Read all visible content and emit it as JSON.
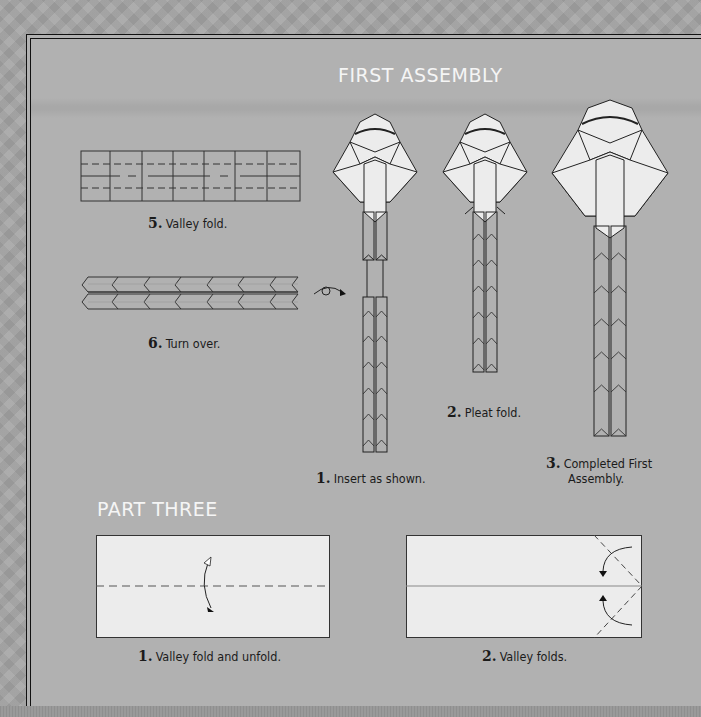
{
  "sections": {
    "first_assembly": {
      "title": "FIRST ASSEMBLY"
    },
    "part_three": {
      "title": "PART THREE"
    }
  },
  "steps_left": [
    {
      "number": "5.",
      "text": "Valley fold."
    },
    {
      "number": "6.",
      "text": "Turn over."
    }
  ],
  "first_assembly_steps": [
    {
      "number": "1.",
      "text": "Insert as shown."
    },
    {
      "number": "2.",
      "text": "Pleat fold."
    },
    {
      "number": "3.",
      "text_line1": "Completed First",
      "text_line2": "Assembly."
    }
  ],
  "part_three_steps": [
    {
      "number": "1.",
      "text": "Valley fold and unfold."
    },
    {
      "number": "2.",
      "text": "Valley folds."
    }
  ],
  "icons": {
    "turn_over": "turn-over-arrow-icon",
    "fold_unfold": "fold-unfold-arrow-icon",
    "valley_fold": "valley-fold-arrow-icon"
  },
  "colors": {
    "page_background": "#b1b1b1",
    "outer_background": "#a3a3a3",
    "title_text": "#f5f5f5",
    "paper": "#ececec",
    "line": "#333333"
  }
}
